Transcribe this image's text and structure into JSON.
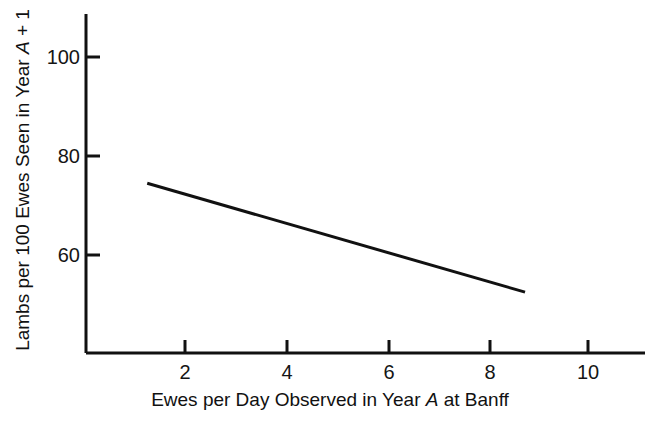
{
  "chart_data": {
    "type": "line",
    "title": "",
    "subtitle": "",
    "xlabel_parts": {
      "before": "Ewes per Day Observed in Year ",
      "italic": "A",
      "after": " at Banff"
    },
    "xlabel": "Ewes per Day Observed in Year A at Banff",
    "ylabel_parts": {
      "before": "Lambs per 100 Ewes Seen in Year ",
      "italic": "A",
      "after": " + 1"
    },
    "ylabel": "Lambs per 100 Ewes Seen in Year A + 1",
    "xlim": [
      0,
      11.0
    ],
    "ylim": [
      31.6,
      100.0
    ],
    "xticks": [
      2,
      4,
      6,
      8,
      10
    ],
    "xtick_labels": [
      "2",
      "4",
      "6",
      "8",
      "10"
    ],
    "yticks": [
      60,
      80,
      100
    ],
    "ytick_labels": [
      "60",
      "80",
      "100"
    ],
    "grid": false,
    "legend": "none",
    "series": [
      {
        "name": "Regression line",
        "style": "solid",
        "color": "#111111",
        "linewidth": 3,
        "points": [
          {
            "x": 1.25,
            "y": 74.5
          },
          {
            "x": 8.75,
            "y": 52.5
          }
        ]
      }
    ],
    "annotations": []
  },
  "axes": {
    "y_axis_name": "y-axis-line",
    "x_axis_name": "x-axis-line"
  },
  "figure": {
    "background_color": "#ffffff",
    "ink_color": "#111111"
  }
}
